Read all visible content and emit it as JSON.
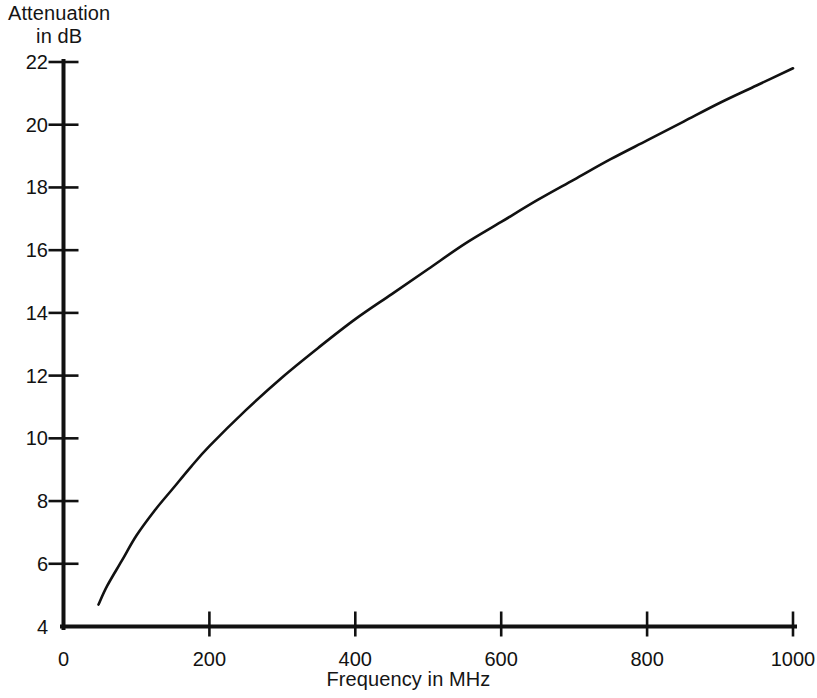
{
  "chart_data": {
    "type": "line",
    "title": "",
    "xlabel": "Frequency in MHz",
    "ylabel": "Attenuation\nin dB",
    "ylabel_line1": "Attenuation",
    "ylabel_line2": "in dB",
    "xlim": [
      0,
      1000
    ],
    "ylim": [
      4,
      22
    ],
    "grid": false,
    "legend": null,
    "x_ticks": [
      0,
      200,
      400,
      600,
      800,
      1000
    ],
    "x_tick_labels": [
      "0",
      "200",
      "400",
      "600",
      "800",
      "1000"
    ],
    "y_ticks": [
      4,
      6,
      8,
      10,
      12,
      14,
      16,
      18,
      20,
      22
    ],
    "y_tick_labels": [
      "4",
      "6",
      "8",
      "10",
      "12",
      "14",
      "16",
      "18",
      "20",
      "22"
    ],
    "line_color": "#111111",
    "series": [
      {
        "name": "Attenuation",
        "x": [
          48,
          60,
          80,
          100,
          125,
          150,
          175,
          200,
          250,
          300,
          350,
          400,
          450,
          500,
          550,
          600,
          650,
          700,
          750,
          800,
          850,
          900,
          950,
          1000
        ],
        "values": [
          4.7,
          5.3,
          6.1,
          6.9,
          7.7,
          8.4,
          9.1,
          9.75,
          10.9,
          11.95,
          12.9,
          13.8,
          14.6,
          15.4,
          16.2,
          16.9,
          17.6,
          18.25,
          18.9,
          19.5,
          20.1,
          20.7,
          21.25,
          21.8
        ]
      }
    ],
    "annotations": []
  },
  "chart": {
    "y_axis_title_line1": "Attenuation",
    "y_axis_title_line2": "in dB",
    "x_axis_title": "Frequency in MHz"
  }
}
